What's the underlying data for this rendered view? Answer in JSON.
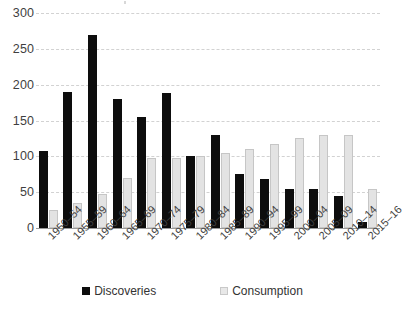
{
  "chart_data": {
    "type": "bar",
    "title": "",
    "subtitle": "",
    "xlabel": "",
    "ylabel": "",
    "ylim": [
      0,
      300
    ],
    "yticks": [
      0,
      50,
      100,
      150,
      200,
      250,
      300
    ],
    "ytick_labels": [
      "0",
      "50",
      "100",
      "150",
      "200",
      "250",
      "300"
    ],
    "grid": true,
    "grid_style": "dashed-horizontal",
    "legend_position": "bottom-center",
    "categories": [
      "1950–54",
      "1955–59",
      "1960–64",
      "1965–69",
      "1970–74",
      "1975–79",
      "1980–84",
      "1985–89",
      "1990–94",
      "1995–99",
      "2000–04",
      "2005–09",
      "2010–14",
      "2015–16"
    ],
    "series": [
      {
        "name": "Discoveries",
        "color": "#0d0d0d",
        "values": [
          107,
          190,
          270,
          180,
          155,
          188,
          100,
          130,
          75,
          68,
          55,
          55,
          45,
          8
        ]
      },
      {
        "name": "Consumption",
        "color": "#e3e3e3",
        "values": [
          25,
          35,
          47,
          70,
          97,
          97,
          100,
          105,
          110,
          117,
          125,
          130,
          130,
          55
        ]
      }
    ]
  },
  "legend": {
    "items": [
      {
        "label": "Discoveries"
      },
      {
        "label": "Consumption"
      }
    ]
  },
  "colors": {
    "discoveries": "#0d0d0d",
    "consumption": "#e3e3e3",
    "gridline": "#d2d2d2",
    "axis": "#9a9a9a",
    "text": "#3f3f3f",
    "background": "#ffffff"
  }
}
